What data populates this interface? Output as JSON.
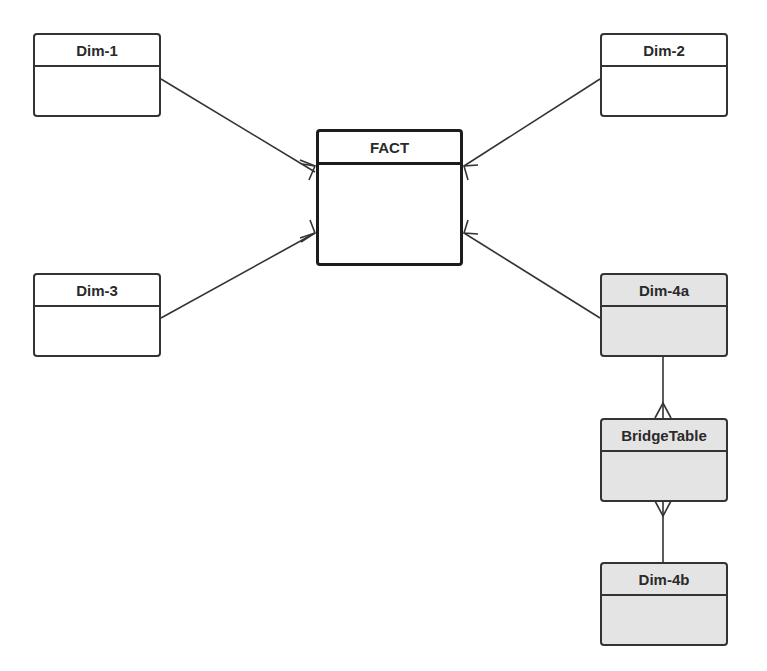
{
  "diagram": {
    "type": "star-schema-er-diagram",
    "entities": [
      {
        "id": "dim1",
        "label": "Dim-1",
        "shaded": false
      },
      {
        "id": "dim2",
        "label": "Dim-2",
        "shaded": false
      },
      {
        "id": "fact",
        "label": "FACT",
        "shaded": false,
        "emphasized": true
      },
      {
        "id": "dim3",
        "label": "Dim-3",
        "shaded": false
      },
      {
        "id": "dim4a",
        "label": "Dim-4a",
        "shaded": true
      },
      {
        "id": "bridge",
        "label": "BridgeTable",
        "shaded": true
      },
      {
        "id": "dim4b",
        "label": "Dim-4b",
        "shaded": true
      }
    ],
    "relationships": [
      {
        "from": "dim1",
        "to": "fact",
        "cardinality": "one-to-many"
      },
      {
        "from": "dim2",
        "to": "fact",
        "cardinality": "one-to-many"
      },
      {
        "from": "dim3",
        "to": "fact",
        "cardinality": "one-to-many"
      },
      {
        "from": "dim4a",
        "to": "fact",
        "cardinality": "one-to-many"
      },
      {
        "from": "dim4a",
        "to": "bridge",
        "cardinality": "one-to-many"
      },
      {
        "from": "dim4b",
        "to": "bridge",
        "cardinality": "one-to-many"
      }
    ]
  },
  "labels": {
    "dim1": "Dim-1",
    "dim2": "Dim-2",
    "fact": "FACT",
    "dim3": "Dim-3",
    "dim4a": "Dim-4a",
    "bridge": "BridgeTable",
    "dim4b": "Dim-4b"
  }
}
